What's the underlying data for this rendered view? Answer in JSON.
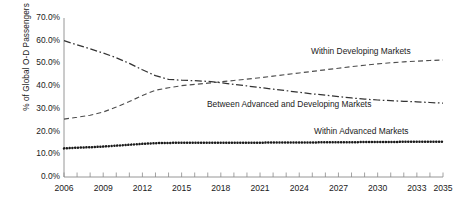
{
  "chart_data": {
    "type": "line",
    "title": "",
    "xlabel": "",
    "ylabel": "% of Global O-D Passengers",
    "xlim": [
      2006,
      2035
    ],
    "ylim": [
      0,
      70
    ],
    "grid": false,
    "legend_position": "inline-annotations",
    "y_tick_labels": [
      "70.0%",
      "60.0%",
      "50.0%",
      "40.0%",
      "30.0%",
      "20.0%",
      "10.0%",
      "0.0%"
    ],
    "y_tick_values": [
      70,
      60,
      50,
      40,
      30,
      20,
      10,
      0
    ],
    "x_tick_labels": [
      "2006",
      "2009",
      "2012",
      "2015",
      "2018",
      "2021",
      "2024",
      "2027",
      "2030",
      "2033",
      "2035"
    ],
    "x_tick_values": [
      2006,
      2009,
      2012,
      2015,
      2018,
      2021,
      2024,
      2027,
      2030,
      2033,
      2035
    ],
    "x": [
      2006,
      2007,
      2008,
      2009,
      2010,
      2011,
      2012,
      2013,
      2014,
      2015,
      2016,
      2017,
      2018,
      2019,
      2020,
      2021,
      2022,
      2023,
      2024,
      2025,
      2026,
      2027,
      2028,
      2029,
      2030,
      2031,
      2032,
      2033,
      2034,
      2035
    ],
    "series": [
      {
        "name": "Within Developing Markets",
        "line_style": "dashed",
        "color": "#4d4d4d",
        "values": [
          25.5,
          26.3,
          27.2,
          28.6,
          30.8,
          33.2,
          35.9,
          38.2,
          39.3,
          40.2,
          40.8,
          41.3,
          41.9,
          42.5,
          43.1,
          43.7,
          44.4,
          45.1,
          45.8,
          46.5,
          47.2,
          47.9,
          48.6,
          49.2,
          49.8,
          50.3,
          50.7,
          51.0,
          51.3,
          51.5
        ]
      },
      {
        "name": "Between Advanced and Developing Markets",
        "line_style": "dash-dot",
        "color": "#333333",
        "values": [
          60.0,
          58.2,
          56.4,
          54.6,
          52.5,
          50.0,
          47.2,
          44.6,
          43.0,
          42.6,
          42.4,
          42.1,
          41.5,
          40.8,
          40.1,
          39.4,
          38.7,
          38.0,
          37.3,
          36.6,
          36.0,
          35.4,
          34.8,
          34.3,
          33.9,
          33.6,
          33.3,
          33.1,
          32.8,
          32.5
        ]
      },
      {
        "name": "Within Advanced Markets",
        "line_style": "dotted",
        "color": "#1a1a1a",
        "values": [
          12.6,
          12.9,
          13.1,
          13.4,
          13.8,
          14.2,
          14.6,
          14.9,
          15.0,
          15.1,
          15.1,
          15.1,
          15.1,
          15.1,
          15.1,
          15.1,
          15.2,
          15.2,
          15.2,
          15.2,
          15.3,
          15.3,
          15.3,
          15.4,
          15.4,
          15.4,
          15.5,
          15.5,
          15.5,
          15.5
        ]
      }
    ],
    "annotations": [
      {
        "text": "Within Developing Markets"
      },
      {
        "text": "Between Advanced and Developing Markets"
      },
      {
        "text": "Within Advanced Markets"
      }
    ]
  },
  "axis": {
    "y_title": "% of Global O-D Passengers"
  }
}
